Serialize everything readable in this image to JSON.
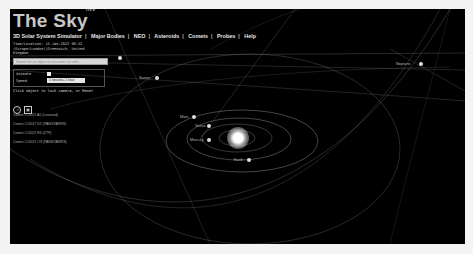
{
  "app": {
    "logo": "The Sky",
    "logo_badge": "live"
  },
  "nav": {
    "items": [
      "3D Solar System Simulator",
      "Major Bodies",
      "NEO",
      "Asteroids",
      "Comets",
      "Probes",
      "Help"
    ]
  },
  "info": {
    "time_location": "Time/Location: 15-Jan-2022 06:52",
    "location_line2": "(Europe/London)|Greenwich, United",
    "location_line3": "Kingdom"
  },
  "search": {
    "placeholder": "Search for an object to encounter for orbit..."
  },
  "controls": {
    "animate_label": "Animate",
    "speed_label": "Speed",
    "speed_value": "1 second = 1 hour",
    "hint": "Click object to lock camera, or Reset"
  },
  "icons": {
    "reset": "reset-icon",
    "camera": "camera-icon"
  },
  "comets": [
    "Comet C/2021 A1 (Leonard)",
    "Comet C/2017 K2 (PANSTARRS)",
    "Comet C/2022 E3 (ZTF)",
    "Comet C/2021 O3 (PANSTARRS)"
  ],
  "bodies": [
    {
      "name": "Neptune",
      "x": 402,
      "y": 55
    },
    {
      "name": "Saturn",
      "x": 147,
      "y": 69
    },
    {
      "name": "Mars",
      "x": 180,
      "y": 108
    },
    {
      "name": "Venus",
      "x": 195,
      "y": 117
    },
    {
      "name": "Mercury",
      "x": 190,
      "y": 131
    },
    {
      "name": "Earth",
      "x": 236,
      "y": 151
    }
  ],
  "colors": {
    "background": "#000000",
    "orbit": "#9a9a9a",
    "text": "#e6e6e6"
  }
}
